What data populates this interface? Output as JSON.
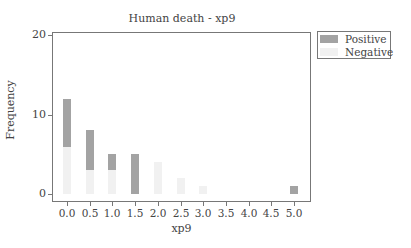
{
  "chart_data": {
    "type": "bar",
    "stacked": true,
    "title": "Human death - xp9",
    "xlabel": "xp9",
    "ylabel": "Frequency",
    "ylim": [
      0,
      20
    ],
    "yticks": [
      "0",
      "10",
      "20"
    ],
    "categories": [
      "0.0",
      "0.5",
      "1.0",
      "1.5",
      "2.0",
      "2.5",
      "3.0",
      "3.5",
      "4.0",
      "4.5",
      "5.0"
    ],
    "series": [
      {
        "name": "Positive",
        "color": "#a3a3a3",
        "values": [
          6,
          5,
          2,
          5,
          0,
          0,
          0,
          0,
          0,
          0,
          1
        ]
      },
      {
        "name": "Negative",
        "color": "#f1f1f1",
        "values": [
          6,
          3,
          3,
          0,
          4,
          2,
          1,
          0,
          0,
          0,
          0
        ]
      }
    ],
    "legend_position": "right-top",
    "grid": false
  },
  "legend": {
    "positive": "Positive",
    "negative": "Negative"
  }
}
